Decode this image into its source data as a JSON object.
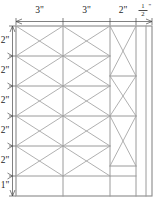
{
  "diagram": {
    "units": "inches",
    "line_color": "#9a9a9a",
    "brace_color": "#a2a2a2",
    "dimension_color": "#4a4a4a",
    "text_color": "#1d1d1d",
    "background": "#ffffff"
  },
  "top_dimensions": [
    {
      "id": "col-1",
      "label": "3\"",
      "value": 3,
      "x_start": 16,
      "x_end": 63
    },
    {
      "id": "col-2",
      "label": "3\"",
      "value": 3,
      "x_start": 63,
      "x_end": 110
    },
    {
      "id": "col-3",
      "label": "2\"",
      "value": 2,
      "x_start": 110,
      "x_end": 136
    },
    {
      "id": "col-4",
      "label_numerator": "1",
      "label_denominator": "2",
      "label_unit": "\"",
      "label": "1/2\"",
      "value": 0.5,
      "x_start": 136,
      "x_end": 152
    }
  ],
  "left_dimensions": [
    {
      "id": "row-1",
      "label": "2\"",
      "value": 2,
      "y_start": 26,
      "y_end": 56
    },
    {
      "id": "row-2",
      "label": "2\"",
      "value": 2,
      "y_start": 56,
      "y_end": 86
    },
    {
      "id": "row-3",
      "label": "2\"",
      "value": 2,
      "y_start": 86,
      "y_end": 116
    },
    {
      "id": "row-4",
      "label": "2\"",
      "value": 2,
      "y_start": 116,
      "y_end": 146
    },
    {
      "id": "row-5",
      "label": "2\"",
      "value": 2,
      "y_start": 146,
      "y_end": 176
    },
    {
      "id": "row-6",
      "label": "1\"",
      "value": 1,
      "y_start": 176,
      "y_end": 196
    }
  ],
  "geometry": {
    "frame": {
      "x": 16,
      "y": 26,
      "width": 136,
      "height": 170
    },
    "column_edges": [
      16,
      63,
      110,
      136,
      152
    ],
    "row_edges": [
      26,
      56,
      86,
      116,
      146,
      176,
      196
    ],
    "braced_columns": [
      {
        "id": "bay-left",
        "x_start": 16,
        "x_end": 63,
        "cell_rows": [
          [
            26,
            56
          ],
          [
            56,
            86
          ],
          [
            86,
            116
          ],
          [
            116,
            146
          ],
          [
            146,
            176
          ]
        ],
        "braced": true
      },
      {
        "id": "bay-middle",
        "x_start": 63,
        "x_end": 110,
        "cell_rows": [
          [
            26,
            56
          ],
          [
            56,
            86
          ],
          [
            86,
            116
          ],
          [
            116,
            146
          ],
          [
            146,
            176
          ]
        ],
        "braced": true
      },
      {
        "id": "bay-right",
        "x_start": 110,
        "x_end": 136,
        "cell_rows": [
          [
            26,
            76
          ],
          [
            76,
            116
          ],
          [
            116,
            166
          ]
        ],
        "braced": true
      },
      {
        "id": "bay-edge",
        "x_start": 136,
        "x_end": 152,
        "cell_rows": [],
        "braced": false
      }
    ],
    "plain_cells": [
      {
        "id": "bottom-left-strip",
        "x_start": 16,
        "x_end": 63,
        "y_start": 176,
        "y_end": 196
      },
      {
        "id": "bottom-mid-strip",
        "x_start": 63,
        "x_end": 110,
        "y_start": 176,
        "y_end": 196
      },
      {
        "id": "bottom-right-strip",
        "x_start": 110,
        "x_end": 136,
        "y_start": 166,
        "y_end": 196
      },
      {
        "id": "edge-strip",
        "x_start": 136,
        "x_end": 152,
        "y_start": 26,
        "y_end": 196
      }
    ]
  }
}
